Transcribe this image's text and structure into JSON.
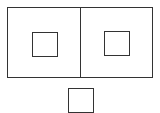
{
  "diagram": {
    "canvas": {
      "width": 160,
      "height": 113,
      "background": "#ffffff"
    },
    "stroke_color": "#333333",
    "stroke_width": 1,
    "shapes": [
      {
        "name": "outer-rectangle-left-panel",
        "x": 7,
        "y": 7,
        "w": 73,
        "h": 70
      },
      {
        "name": "outer-rectangle-right-panel",
        "x": 80,
        "y": 7,
        "w": 72,
        "h": 70
      },
      {
        "name": "inner-square-left",
        "x": 32,
        "y": 32,
        "w": 25,
        "h": 24
      },
      {
        "name": "inner-square-right",
        "x": 104,
        "y": 31,
        "w": 25,
        "h": 24
      },
      {
        "name": "bottom-square",
        "x": 68,
        "y": 88,
        "w": 25,
        "h": 24
      }
    ]
  }
}
